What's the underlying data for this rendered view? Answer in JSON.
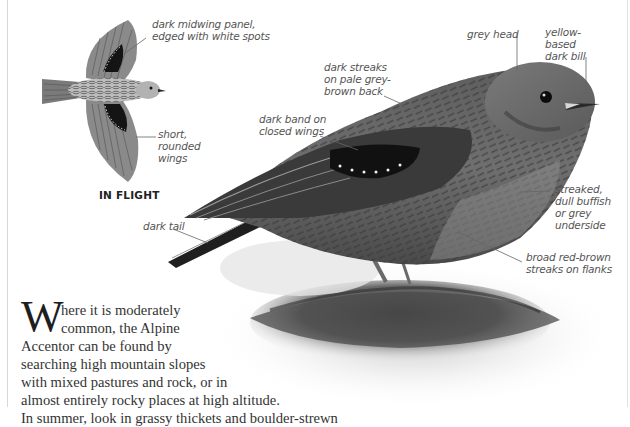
{
  "illustration": {
    "flight_caption": "IN FLIGHT",
    "flight_labels": [
      {
        "id": "midwing-panel",
        "text": "dark midwing panel,\nedged with white spots"
      },
      {
        "id": "rounded-wings",
        "text": "short,\nrounded\nwings"
      }
    ],
    "perched_labels": [
      {
        "id": "grey-head",
        "text": "grey head"
      },
      {
        "id": "bill",
        "text": "yellow-\nbased\ndark bill"
      },
      {
        "id": "back-streaks",
        "text": "dark streaks\non pale grey-\nbrown back"
      },
      {
        "id": "wing-band",
        "text": "dark band on\nclosed wings"
      },
      {
        "id": "underside",
        "text": "streaked,\ndull buffish\nor grey\nunderside"
      },
      {
        "id": "tail",
        "text": "dark tail"
      },
      {
        "id": "flank-streaks",
        "text": "broad red-brown\nstreaks on flanks"
      }
    ]
  },
  "body": {
    "drop_cap": "W",
    "lines": [
      "here it is moderately",
      "common, the Alpine",
      "Accentor can be found by",
      "searching high mountain slopes",
      "with mixed pastures and rock, or in",
      "almost entirely rocky places at high altitude.",
      "In summer, look in grassy thickets and boulder-strewn"
    ]
  },
  "colors": {
    "text": "#333333",
    "label": "#555555",
    "leader_line": "#666666",
    "bird_dark": "#2a2a2a",
    "bird_mid": "#6e6e6e",
    "bird_light": "#a8a8a8"
  }
}
